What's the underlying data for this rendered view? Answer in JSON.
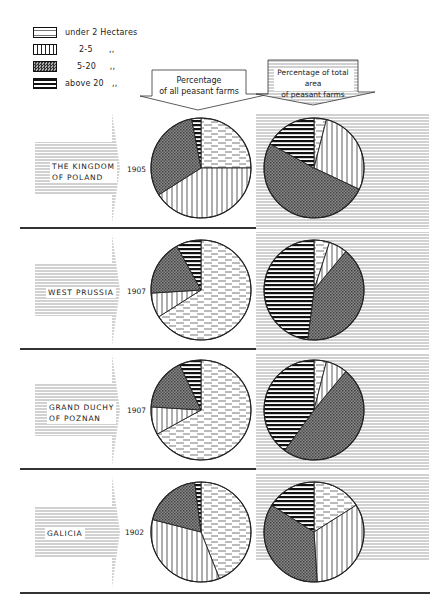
{
  "legend": {
    "items": [
      {
        "key": "under2",
        "label": "under 2 Hectares",
        "pattern": "dashed-horizontal"
      },
      {
        "key": "2to5",
        "label": "2-5      ,,",
        "pattern": "vertical-lines"
      },
      {
        "key": "5to20",
        "label": "5-20     ,,",
        "pattern": "crosshatch"
      },
      {
        "key": "above20",
        "label": "above 20   ,,",
        "pattern": "bold-horizontal"
      }
    ]
  },
  "headers": {
    "farms": {
      "line1": "Percentage",
      "line2": "of all peasant farms"
    },
    "area": {
      "line1": "Percentage of total area",
      "line2": "of peasant farms"
    }
  },
  "rows": [
    {
      "region_line1": "THE KINGDOM",
      "region_line2": "OF POLAND",
      "year": "1905"
    },
    {
      "region_line1": "WEST PRUSSIA",
      "region_line2": "",
      "year": "1907"
    },
    {
      "region_line1": "GRAND DUCHY",
      "region_line2": "OF POZNAN",
      "year": "1907"
    },
    {
      "region_line1": "GALICIA",
      "region_line2": "",
      "year": "1902"
    }
  ],
  "chart_data": {
    "type": "pie",
    "values_note": "approximate, estimated from slice angles; no data labels are printed on the chart",
    "legend_position": "top-left",
    "categories": [
      "under 2 Hectares",
      "2-5 Hectares",
      "5-20 Hectares",
      "above 20 Hectares"
    ],
    "columns": [
      "Percentage of all peasant farms",
      "Percentage of total area of peasant farms"
    ],
    "regions": [
      {
        "name": "The Kingdom of Poland",
        "year": "1905",
        "farms": [
          25,
          41,
          31,
          3
        ],
        "area": [
          4,
          28,
          51,
          17
        ]
      },
      {
        "name": "West Prussia",
        "year": "1907",
        "farms": [
          66,
          8,
          18,
          8
        ],
        "area": [
          5,
          6,
          41,
          48
        ]
      },
      {
        "name": "Grand Duchy of Poznan",
        "year": "1907",
        "farms": [
          67,
          9,
          17,
          7
        ],
        "area": [
          4,
          7,
          49,
          40
        ]
      },
      {
        "name": "Galicia",
        "year": "1902",
        "farms": [
          44,
          35,
          19,
          2
        ],
        "area": [
          16,
          33,
          35,
          16
        ]
      }
    ]
  }
}
